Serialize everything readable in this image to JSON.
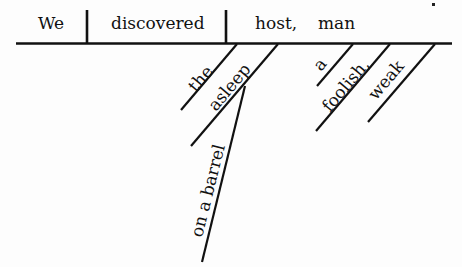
{
  "diagram": {
    "type": "sentence-diagram",
    "baseline": {
      "subject": "We",
      "verb": "discovered",
      "object": "host,",
      "appositive": "man"
    },
    "modifiers": [
      {
        "word": "the",
        "modifies": "host"
      },
      {
        "word": "asleep",
        "modifies": "host"
      },
      {
        "word": "on a barrel",
        "modifies": "asleep"
      },
      {
        "word": "a",
        "modifies": "man"
      },
      {
        "word": "foolish,",
        "modifies": "man"
      },
      {
        "word": "weak",
        "modifies": "man"
      }
    ]
  }
}
